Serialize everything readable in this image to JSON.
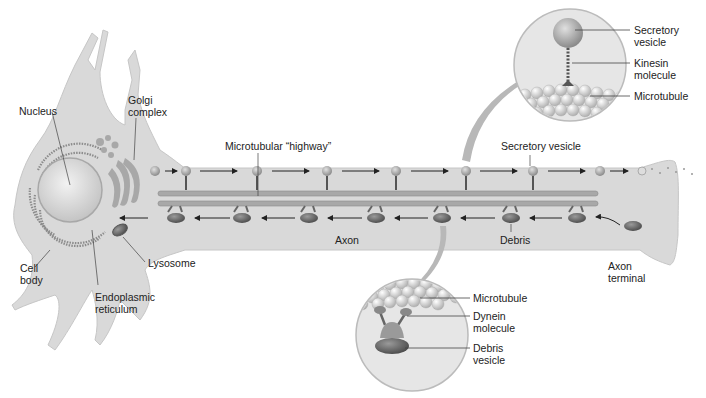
{
  "diagram": {
    "colors": {
      "cell": "#d9d9d9",
      "cell_edge": "#bdbdbd",
      "microtubule": "#a8a8a8",
      "vesicle": "#9a9a9a",
      "debris": "#6e6e6e",
      "arrow": "#222222",
      "callout_arrow": "#b4b4b4"
    },
    "labels": {
      "nucleus": "Nucleus",
      "golgi": "Golgi\ncomplex",
      "cell_body": "Cell\nbody",
      "er": "Endoplasmic\nreticulum",
      "lysosome": "Lysosome",
      "highway": "Microtubular “highway”",
      "secretory_vesicle": "Secretory vesicle",
      "axon": "Axon",
      "debris": "Debris",
      "axon_terminal": "Axon\nterminal"
    },
    "inset_top": {
      "labels": [
        "Secretory\nvesicle",
        "Kinesin\nmolecule",
        "Microtubule"
      ]
    },
    "inset_bottom": {
      "labels": [
        "Microtubule",
        "Dynein\nmolecule",
        "Debris\nvesicle"
      ]
    }
  }
}
